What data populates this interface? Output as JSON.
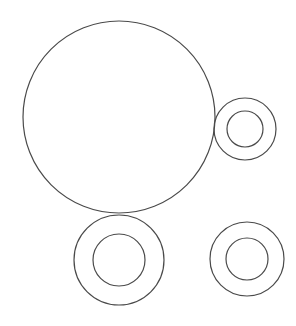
{
  "diagram": {
    "background": "#ffffff",
    "stroke_color": "#4a4a4a",
    "stroke_width": 1.2,
    "shapes": [
      {
        "id": "large-circle",
        "type": "circle",
        "cx": 119,
        "cy": 117,
        "r": 96
      },
      {
        "id": "ring-top-right-outer",
        "type": "circle",
        "cx": 245,
        "cy": 129,
        "r": 31
      },
      {
        "id": "ring-top-right-inner",
        "type": "circle",
        "cx": 245,
        "cy": 129,
        "r": 18
      },
      {
        "id": "ring-bottom-left-outer",
        "type": "circle",
        "cx": 119,
        "cy": 260,
        "r": 45
      },
      {
        "id": "ring-bottom-left-inner",
        "type": "circle",
        "cx": 119,
        "cy": 260,
        "r": 26
      },
      {
        "id": "ring-bottom-right-outer",
        "type": "circle",
        "cx": 247,
        "cy": 259,
        "r": 37
      },
      {
        "id": "ring-bottom-right-inner",
        "type": "circle",
        "cx": 247,
        "cy": 259,
        "r": 21
      }
    ]
  }
}
